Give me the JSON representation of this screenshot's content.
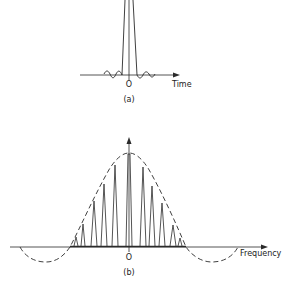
{
  "figure": {
    "panel_a": {
      "caption": "(a)",
      "x_axis_label": "Time",
      "origin_label": "O"
    },
    "panel_b": {
      "caption": "(b)",
      "x_axis_label": "Frequency",
      "origin_label": "O"
    }
  },
  "colors": {
    "ink": "#2a2a2a",
    "background": "#ffffff"
  }
}
